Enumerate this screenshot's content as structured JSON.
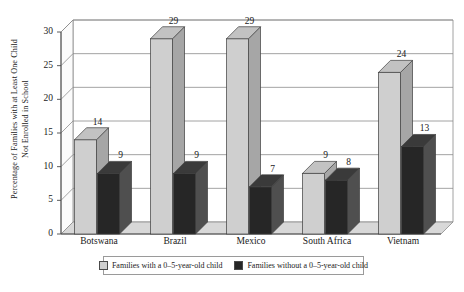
{
  "chart_data": {
    "type": "bar",
    "title": "",
    "subtitle": "",
    "xlabel": "",
    "ylabel": "Percentage of Families with at Least One Child Not Enrolled in School",
    "ylabel_lines": [
      "Percentage of Families with at Least One Child",
      "Not Enrolled in School"
    ],
    "categories": [
      "Botswana",
      "Brazil",
      "Mexico",
      "South Africa",
      "Vietnam"
    ],
    "series": [
      {
        "name": "Families with a 0–5-year-old child",
        "values": [
          14,
          29,
          29,
          9,
          24
        ],
        "color": "#cfcfcf"
      },
      {
        "name": "Families without a 0–5-year-old child",
        "values": [
          9,
          9,
          7,
          8,
          13
        ],
        "color": "#262626"
      }
    ],
    "ylim": [
      0,
      30
    ],
    "yticks": [
      0,
      5,
      10,
      15,
      20,
      25,
      30
    ],
    "ytick_labels": [
      "0",
      "5",
      "10",
      "15",
      "20",
      "25",
      "30"
    ],
    "grid": true,
    "grid_axis": "y",
    "legend_position": "bottom",
    "style": "3d-column",
    "data_labels": true
  },
  "legend": {
    "items": [
      {
        "label": "Families with a 0–5-year-old child",
        "swatch": "light-swatch"
      },
      {
        "label": "Families without a 0–5-year-old child",
        "swatch": "dark-swatch"
      }
    ]
  },
  "colors": {
    "light_front": "#cfcfcf",
    "light_side": "#a6a6a6",
    "light_top": "#c2c2c2",
    "dark_front": "#262626",
    "dark_side": "#4f4f4f",
    "dark_top": "#3a3a3a",
    "grid": "#8c8c8c",
    "axis": "#4a4a4a",
    "wall": "#ffffff",
    "floor": "#d8d8d8"
  }
}
